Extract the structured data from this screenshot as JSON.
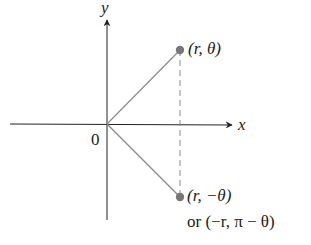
{
  "diagram": {
    "axes": {
      "x_label": "x",
      "y_label": "y",
      "origin_label": "0"
    },
    "points": [
      {
        "label": "(r, θ)",
        "position": "upper"
      },
      {
        "label": "(r, −θ)",
        "position": "lower",
        "alt_label": "or (−r, π − θ)"
      }
    ],
    "colors": {
      "axis": "#222222",
      "segment": "#8a8a8a",
      "point": "#777777",
      "dashed": "#888888"
    }
  }
}
